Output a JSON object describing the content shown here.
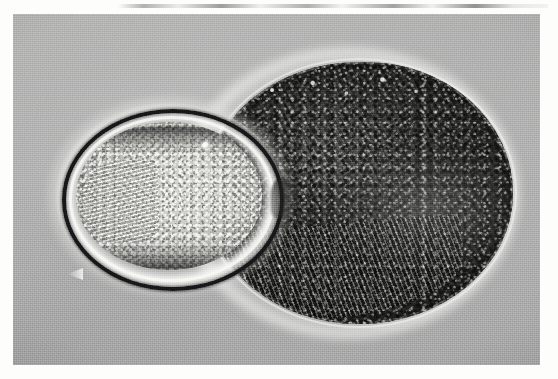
{
  "image": {
    "kind": "light-micrograph",
    "modality_hint": "phase-contrast",
    "color_mode": "grayscale",
    "width_px": 558,
    "height_px": 379,
    "paper_background_hex": "#fdfdfc",
    "plate": {
      "left_px": 13,
      "top_px": 14,
      "width_px": 527,
      "height_px": 351,
      "background_hex": "#adaeae"
    },
    "artifacts": {
      "top_scan_smudge": "thin dark horizontal streak across the upper white margin"
    }
  },
  "subjects": [
    {
      "id": "small-oval",
      "label": "small bright ovoid body",
      "position": "left of centre",
      "bounds_px": {
        "x": 49,
        "y": 95,
        "w": 214,
        "h": 174
      },
      "appearance": "bright granular interior enclosed by a light membrane ring, a strong black outer ring and a faint diffraction halo",
      "features": [
        "black outer ring",
        "light vitelline membrane ring",
        "fine granular cytoplasm",
        "comb-like fibrous striations at the left pole",
        "bright refractile globule on the upper membrane",
        "dark arcs at inner top and bottom"
      ],
      "fill_hex": "#cbcbc5",
      "ring_hex": "#17171a"
    },
    {
      "id": "large-oval",
      "label": "large dark ovoid mass",
      "position": "right of centre, overlapping the small ovoid",
      "bounds_px": {
        "x": 192,
        "y": 48,
        "w": 308,
        "h": 262
      },
      "appearance": "densely packed coarse dark granules with swirling fibrous striations, bordered by a bright phase rim",
      "features": [
        "bright phase-contrast rim",
        "coarse dark granules",
        "swirled fibrous striations",
        "lighter dappled zone across the middle",
        "tattered ventral rim at the lower left",
        "bright speckles along the upper circumference"
      ],
      "fill_hex": "#45453f",
      "rim_hex": "#f2f2ee"
    }
  ],
  "palette": {
    "paper": "#fdfdfc",
    "background_gray": "#adaeae",
    "highlight": "#f2f2ee",
    "midtone": "#cbcbc5",
    "shadow": "#45453f",
    "darkest": "#17171a"
  }
}
